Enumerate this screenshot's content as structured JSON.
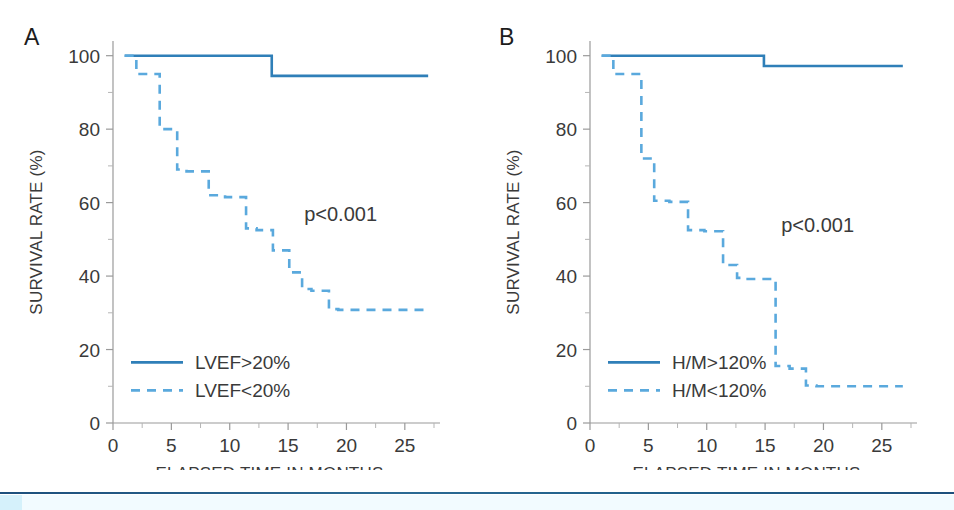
{
  "figure": {
    "background_color": "#ffffff",
    "series_solid_color": "#2f7fb8",
    "series_dashed_color": "#5aa9dd",
    "axis_color": "#9a9a9a",
    "text_color": "#3a3a3a",
    "bottom_rule_color": "#1d4f7c",
    "bottom_tint_color": "#f2fbff",
    "bottom_swatch_color": "#d5f1fb"
  },
  "panels": [
    {
      "id": "A",
      "label": "A",
      "pvalue": "p<0.001",
      "legend": [
        {
          "label": "LVEF>20%",
          "style": "solid"
        },
        {
          "label": "LVEF<20%",
          "style": "dashed"
        }
      ],
      "chart_data": {
        "type": "line",
        "title": "",
        "xlabel": "ELAPSED TIME IN MONTHS",
        "ylabel": "SURVIVAL RATE (%)",
        "xlim": [
          0,
          27.5
        ],
        "ylim": [
          0,
          104
        ],
        "xticks": [
          0,
          5,
          10,
          15,
          20,
          25
        ],
        "xticks_minor": [
          2.5,
          7.5,
          12.5,
          17.5,
          22.5,
          27.5
        ],
        "yticks": [
          0,
          20,
          40,
          60,
          80,
          100
        ],
        "yticks_minor": [
          10,
          30,
          50,
          70,
          90
        ],
        "grid": false,
        "legend_position": "lower-left",
        "annotations": [
          {
            "text": "p<0.001",
            "x": 19.5,
            "y": 55
          }
        ],
        "series": [
          {
            "name": "LVEF>20%",
            "style": "solid",
            "color": "#2f7fb8",
            "x": [
              1.0,
              12.2,
              13.6,
              27.0
            ],
            "y": [
              100,
              100,
              94.5,
              94.5
            ]
          },
          {
            "name": "LVEF<20%",
            "style": "dashed",
            "color": "#5aa9dd",
            "x": [
              1.0,
              2.0,
              4.0,
              5.5,
              6.3,
              8.2,
              9.6,
              11.4,
              12.3,
              13.7,
              15.1,
              16.2,
              17.0,
              18.5,
              19.3,
              27.0
            ],
            "y": [
              100,
              95,
              80,
              69,
              68.5,
              62,
              61.5,
              53,
              52.5,
              47,
              41,
              36.5,
              36,
              31,
              30.8,
              30.8
            ]
          }
        ]
      }
    },
    {
      "id": "B",
      "label": "B",
      "pvalue": "p<0.001",
      "legend": [
        {
          "label": "H/M>120%",
          "style": "solid"
        },
        {
          "label": "H/M<120%",
          "style": "dashed"
        }
      ],
      "chart_data": {
        "type": "line",
        "title": "",
        "xlabel": "ELAPSED TIME IN MONTHS",
        "ylabel": "SURVIVAL RATE (%)",
        "xlim": [
          0,
          27.5
        ],
        "ylim": [
          0,
          104
        ],
        "xticks": [
          0,
          5,
          10,
          15,
          20,
          25
        ],
        "xticks_minor": [
          2.5,
          7.5,
          12.5,
          17.5,
          22.5,
          27.5
        ],
        "yticks": [
          0,
          20,
          40,
          60,
          80,
          100
        ],
        "yticks_minor": [
          10,
          30,
          50,
          70,
          90
        ],
        "grid": false,
        "legend_position": "lower-left",
        "annotations": [
          {
            "text": "p<0.001",
            "x": 19.5,
            "y": 52
          }
        ],
        "series": [
          {
            "name": "H/M>120%",
            "style": "solid",
            "color": "#2f7fb8",
            "x": [
              1.0,
              14.0,
              14.9,
              26.8
            ],
            "y": [
              100,
              100,
              97.2,
              97.2
            ]
          },
          {
            "name": "H/M<120%",
            "style": "dashed",
            "color": "#5aa9dd",
            "x": [
              1.0,
              2.0,
              4.4,
              5.5,
              6.8,
              8.4,
              9.8,
              11.4,
              12.6,
              13.3,
              15.9,
              17.1,
              18.5,
              19.4,
              26.8
            ],
            "y": [
              100,
              95,
              72,
              60.5,
              60.2,
              52.5,
              52.2,
              43,
              39.5,
              39.2,
              15.5,
              14.8,
              10.2,
              10,
              10
            ]
          }
        ]
      }
    }
  ]
}
